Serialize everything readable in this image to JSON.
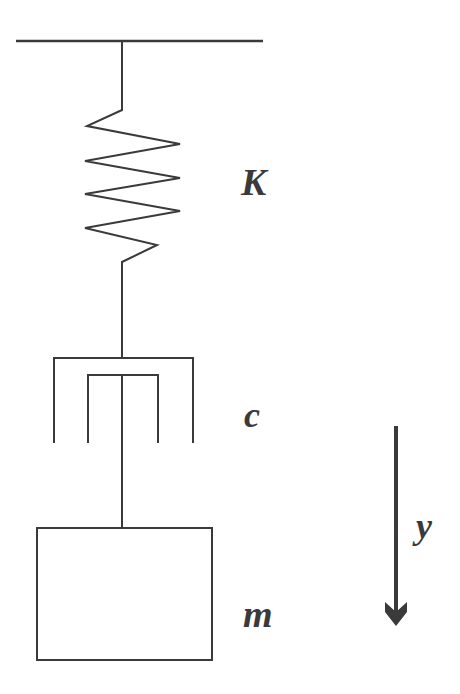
{
  "diagram": {
    "type": "spring-mass-damper",
    "stroke_color": "#3a3a3a",
    "background": "#ffffff",
    "labels": {
      "spring": "K",
      "damper": "c",
      "mass": "m",
      "displacement": "y"
    },
    "components": [
      {
        "name": "fixed-support",
        "kind": "ground-line"
      },
      {
        "name": "spring",
        "kind": "zigzag",
        "label": "K"
      },
      {
        "name": "damper",
        "kind": "dashpot",
        "label": "c"
      },
      {
        "name": "mass",
        "kind": "block",
        "label": "m"
      },
      {
        "name": "displacement-arrow",
        "kind": "arrow",
        "direction": "down",
        "label": "y"
      }
    ]
  }
}
